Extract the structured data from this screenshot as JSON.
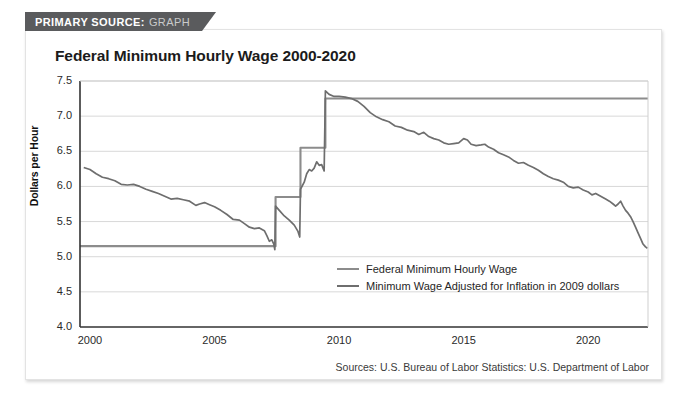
{
  "banner": {
    "label": "PRIMARY SOURCE:",
    "value": "GRAPH"
  },
  "source_note": "Sources: U.S. Bureau of Labor Statistics: U.S. Department of Labor",
  "colors": {
    "nominal": "#8c8c8c",
    "adjusted": "#6e6e6e",
    "axis": "#333333",
    "grid": "#d8d8d8",
    "banner_bg": "#5a5b5d",
    "card_bg": "#ffffff"
  },
  "chart_data": {
    "type": "line",
    "title": "Federal Minimum Hourly Wage 2000-2020",
    "xlabel": "",
    "ylabel": "Dollars per Hour",
    "xlim": [
      1999.6,
      2022.4
    ],
    "ylim": [
      4.0,
      7.5
    ],
    "yticks": [
      "7.5",
      "7.0",
      "6.5",
      "6.0",
      "5.5",
      "5.0",
      "4.5",
      "4.0"
    ],
    "ytick_values": [
      7.5,
      7.0,
      6.5,
      6.0,
      5.5,
      5.0,
      4.5,
      4.0
    ],
    "xticks": [
      "2000",
      "2005",
      "2010",
      "2015",
      "2020"
    ],
    "xtick_values": [
      2000,
      2005,
      2010,
      2015,
      2020
    ],
    "grid": true,
    "legend_position": "inside-center-bottom",
    "series": [
      {
        "name": "Federal Minimum Hourly Wage",
        "color": "#8c8c8c",
        "style": "step",
        "points": [
          [
            1999.6,
            5.15
          ],
          [
            2007.45,
            5.15
          ],
          [
            2007.45,
            5.85
          ],
          [
            2008.45,
            5.85
          ],
          [
            2008.45,
            6.55
          ],
          [
            2009.45,
            6.55
          ],
          [
            2009.45,
            7.25
          ],
          [
            2022.4,
            7.25
          ]
        ]
      },
      {
        "name": "Minimum Wage Adjusted for Inflation in 2009 dollars",
        "color": "#6e6e6e",
        "style": "line",
        "points": [
          [
            1999.75,
            6.27
          ],
          [
            2000.0,
            6.24
          ],
          [
            2000.25,
            6.18
          ],
          [
            2000.5,
            6.13
          ],
          [
            2000.75,
            6.11
          ],
          [
            2001.0,
            6.08
          ],
          [
            2001.25,
            6.03
          ],
          [
            2001.5,
            6.02
          ],
          [
            2001.75,
            6.03
          ],
          [
            2002.0,
            6.0
          ],
          [
            2002.25,
            5.96
          ],
          [
            2002.5,
            5.93
          ],
          [
            2002.75,
            5.9
          ],
          [
            2003.0,
            5.86
          ],
          [
            2003.25,
            5.82
          ],
          [
            2003.5,
            5.83
          ],
          [
            2003.75,
            5.81
          ],
          [
            2004.0,
            5.79
          ],
          [
            2004.25,
            5.73
          ],
          [
            2004.4,
            5.75
          ],
          [
            2004.6,
            5.77
          ],
          [
            2004.8,
            5.74
          ],
          [
            2005.0,
            5.71
          ],
          [
            2005.25,
            5.66
          ],
          [
            2005.5,
            5.6
          ],
          [
            2005.75,
            5.53
          ],
          [
            2006.0,
            5.52
          ],
          [
            2006.2,
            5.47
          ],
          [
            2006.4,
            5.42
          ],
          [
            2006.6,
            5.4
          ],
          [
            2006.8,
            5.41
          ],
          [
            2007.0,
            5.37
          ],
          [
            2007.1,
            5.3
          ],
          [
            2007.2,
            5.22
          ],
          [
            2007.3,
            5.24
          ],
          [
            2007.38,
            5.18
          ],
          [
            2007.42,
            5.1
          ],
          [
            2007.45,
            5.72
          ],
          [
            2007.6,
            5.66
          ],
          [
            2007.8,
            5.58
          ],
          [
            2008.0,
            5.52
          ],
          [
            2008.2,
            5.45
          ],
          [
            2008.35,
            5.36
          ],
          [
            2008.42,
            5.28
          ],
          [
            2008.45,
            5.96
          ],
          [
            2008.6,
            6.06
          ],
          [
            2008.7,
            6.18
          ],
          [
            2008.8,
            6.24
          ],
          [
            2008.9,
            6.22
          ],
          [
            2009.0,
            6.26
          ],
          [
            2009.1,
            6.35
          ],
          [
            2009.2,
            6.3
          ],
          [
            2009.3,
            6.31
          ],
          [
            2009.4,
            6.22
          ],
          [
            2009.45,
            7.36
          ],
          [
            2009.6,
            7.31
          ],
          [
            2009.8,
            7.28
          ],
          [
            2010.0,
            7.28
          ],
          [
            2010.25,
            7.27
          ],
          [
            2010.5,
            7.25
          ],
          [
            2010.75,
            7.21
          ],
          [
            2011.0,
            7.14
          ],
          [
            2011.25,
            7.05
          ],
          [
            2011.5,
            6.99
          ],
          [
            2011.75,
            6.95
          ],
          [
            2012.0,
            6.92
          ],
          [
            2012.25,
            6.86
          ],
          [
            2012.5,
            6.84
          ],
          [
            2012.75,
            6.8
          ],
          [
            2013.0,
            6.78
          ],
          [
            2013.2,
            6.74
          ],
          [
            2013.4,
            6.77
          ],
          [
            2013.6,
            6.71
          ],
          [
            2013.8,
            6.68
          ],
          [
            2014.0,
            6.66
          ],
          [
            2014.2,
            6.62
          ],
          [
            2014.4,
            6.6
          ],
          [
            2014.6,
            6.61
          ],
          [
            2014.8,
            6.62
          ],
          [
            2015.0,
            6.68
          ],
          [
            2015.15,
            6.66
          ],
          [
            2015.3,
            6.6
          ],
          [
            2015.5,
            6.58
          ],
          [
            2015.7,
            6.59
          ],
          [
            2015.85,
            6.6
          ],
          [
            2016.0,
            6.56
          ],
          [
            2016.2,
            6.53
          ],
          [
            2016.4,
            6.48
          ],
          [
            2016.6,
            6.45
          ],
          [
            2016.8,
            6.42
          ],
          [
            2017.0,
            6.37
          ],
          [
            2017.2,
            6.33
          ],
          [
            2017.4,
            6.34
          ],
          [
            2017.6,
            6.3
          ],
          [
            2017.8,
            6.27
          ],
          [
            2018.0,
            6.23
          ],
          [
            2018.2,
            6.18
          ],
          [
            2018.4,
            6.14
          ],
          [
            2018.6,
            6.11
          ],
          [
            2018.8,
            6.09
          ],
          [
            2019.0,
            6.06
          ],
          [
            2019.2,
            6.0
          ],
          [
            2019.4,
            5.98
          ],
          [
            2019.6,
            5.99
          ],
          [
            2019.8,
            5.95
          ],
          [
            2020.0,
            5.92
          ],
          [
            2020.15,
            5.88
          ],
          [
            2020.3,
            5.9
          ],
          [
            2020.5,
            5.86
          ],
          [
            2020.7,
            5.82
          ],
          [
            2020.85,
            5.79
          ],
          [
            2021.0,
            5.75
          ],
          [
            2021.1,
            5.72
          ],
          [
            2021.2,
            5.75
          ],
          [
            2021.3,
            5.79
          ],
          [
            2021.4,
            5.72
          ],
          [
            2021.5,
            5.66
          ],
          [
            2021.6,
            5.62
          ],
          [
            2021.7,
            5.57
          ],
          [
            2021.8,
            5.5
          ],
          [
            2021.9,
            5.42
          ],
          [
            2022.0,
            5.34
          ],
          [
            2022.1,
            5.26
          ],
          [
            2022.2,
            5.18
          ],
          [
            2022.3,
            5.14
          ],
          [
            2022.38,
            5.12
          ]
        ]
      }
    ]
  }
}
